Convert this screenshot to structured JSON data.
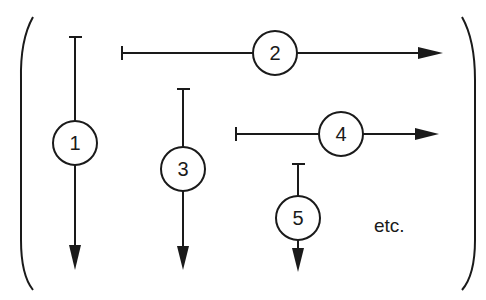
{
  "diagram": {
    "colors": {
      "ink": "#1a1a1a",
      "background": "#ffffff"
    },
    "arrows": [
      {
        "label": "1",
        "orientation": "vertical"
      },
      {
        "label": "2",
        "orientation": "horizontal"
      },
      {
        "label": "3",
        "orientation": "vertical"
      },
      {
        "label": "4",
        "orientation": "horizontal"
      },
      {
        "label": "5",
        "orientation": "vertical"
      }
    ],
    "continuation_text": "etc.",
    "brackets": {
      "left": "(",
      "right": ")"
    }
  }
}
